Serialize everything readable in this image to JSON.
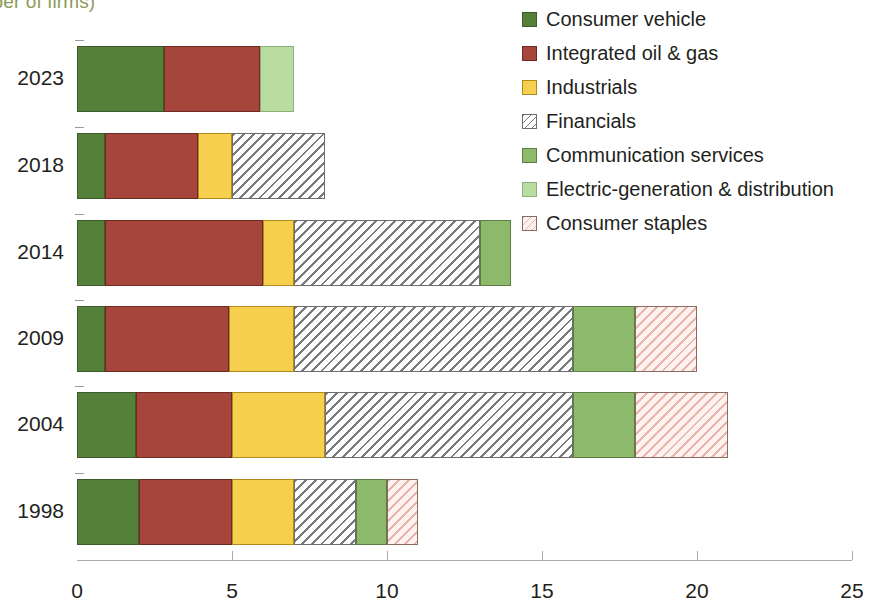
{
  "subtitle": "umber of firms)",
  "chart_data": {
    "type": "bar",
    "orientation": "horizontal",
    "stacked": true,
    "title": "umber of firms)",
    "xlabel": "",
    "ylabel": "",
    "xlim": [
      0,
      25
    ],
    "xticks": [
      0,
      5,
      10,
      15,
      20,
      25
    ],
    "xticklabels": [
      "0",
      "5",
      "10",
      "15",
      "20",
      "25"
    ],
    "grid": false,
    "legend_position": "top-right",
    "categories": [
      "2023",
      "2018",
      "2014",
      "2009",
      "2004",
      "1998"
    ],
    "series": [
      {
        "name": "Consumer vehicle",
        "color": "#55803a",
        "pattern": "solid",
        "values": [
          2.8,
          0.9,
          0.9,
          0.9,
          1.9,
          2.0
        ]
      },
      {
        "name": "Integrated oil & gas",
        "color": "#a6453c",
        "pattern": "solid",
        "values": [
          3.1,
          3.0,
          5.1,
          4.0,
          3.1,
          3.0
        ]
      },
      {
        "name": "Industrials",
        "color": "#f7cf4f",
        "pattern": "solid",
        "values": [
          0.0,
          1.1,
          1.0,
          2.1,
          3.0,
          2.0
        ]
      },
      {
        "name": "Financials",
        "color": "#ffffff",
        "pattern": "hatch-gray",
        "values": [
          0.0,
          3.0,
          6.0,
          9.0,
          8.0,
          2.0
        ]
      },
      {
        "name": "Communication services",
        "color": "#8cb96a",
        "pattern": "solid",
        "values": [
          0.0,
          0.0,
          1.0,
          2.0,
          2.0,
          1.0
        ]
      },
      {
        "name": "Electric-generation & distribution",
        "color": "#b9dca0",
        "pattern": "solid",
        "values": [
          1.1,
          0.0,
          0.0,
          0.0,
          0.0,
          0.0
        ]
      },
      {
        "name": "Consumer staples",
        "color": "#ffffff",
        "pattern": "hatch-pink",
        "values": [
          0.0,
          0.0,
          0.0,
          2.0,
          3.0,
          1.0
        ]
      }
    ],
    "totals": [
      7.0,
      8.0,
      14.0,
      20.0,
      21.0,
      11.0
    ]
  },
  "legend": {
    "items": [
      {
        "label": "Consumer vehicle",
        "key": "cv"
      },
      {
        "label": "Integrated oil & gas",
        "key": "oil"
      },
      {
        "label": "Industrials",
        "key": "ind"
      },
      {
        "label": "Financials",
        "key": "fin"
      },
      {
        "label": "Communication services",
        "key": "comm"
      },
      {
        "label": "Electric-generation & distribution",
        "key": "elec"
      },
      {
        "label": "Consumer staples",
        "key": "staples"
      }
    ]
  }
}
